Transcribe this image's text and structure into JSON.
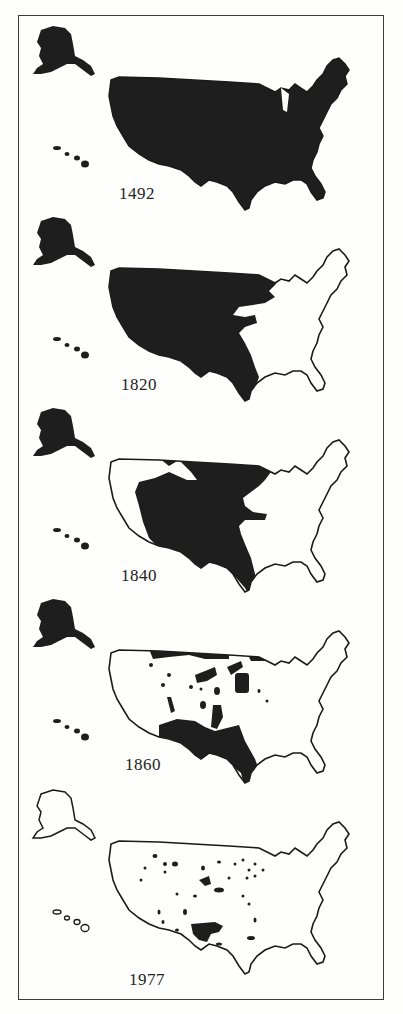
{
  "figure": {
    "fill_color": "#1e1e1e",
    "outline_color": "#1a1a1a",
    "background_color": "#fefefc",
    "frame_color": "#3a3a3a"
  },
  "panels": [
    {
      "year": "1492",
      "state": "all-native-land",
      "alaska_filled": true,
      "hawaii_filled": true
    },
    {
      "year": "1820",
      "state": "west-of-mississippi-native-land",
      "alaska_filled": true,
      "hawaii_filled": true
    },
    {
      "year": "1840",
      "state": "great-plains-and-southwest-native-land",
      "alaska_filled": true,
      "hawaii_filled": true
    },
    {
      "year": "1860",
      "state": "scattered-reservations-and-southwest",
      "alaska_filled": true,
      "hawaii_filled": true
    },
    {
      "year": "1977",
      "state": "small-scattered-reservations",
      "alaska_filled": false,
      "hawaii_filled": false
    }
  ]
}
